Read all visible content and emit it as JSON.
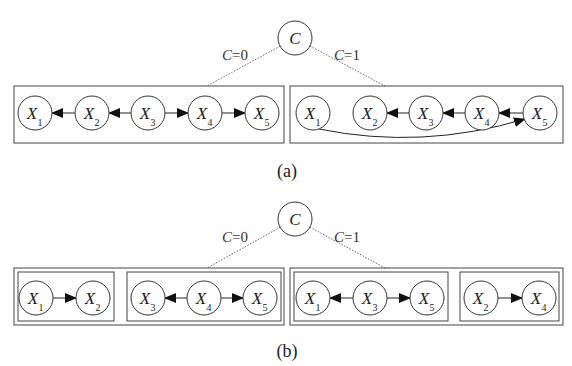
{
  "figure": {
    "panels": [
      {
        "id": "a",
        "caption": "(a)",
        "caption_pos": [
          287,
          177
        ],
        "root": {
          "label": "C",
          "x": 295,
          "y": 38,
          "r": 17
        },
        "branches": [
          {
            "label_var": "C",
            "label_val": "=0",
            "label_pos": [
              222,
              60
            ],
            "line_to": [
              207,
              86
            ]
          },
          {
            "label_var": "C",
            "label_val": "=1",
            "label_pos": [
              334,
              60
            ],
            "line_to": [
              385,
              86
            ]
          }
        ],
        "groups": [
          {
            "name": "c0-network",
            "outer": {
              "x": 14,
              "y": 86,
              "w": 270,
              "h": 57
            },
            "inner": [],
            "nodes": [
              {
                "id": "X1",
                "var": "X",
                "sub": "1",
                "x": 35,
                "y": 113
              },
              {
                "id": "X2",
                "var": "X",
                "sub": "2",
                "x": 92,
                "y": 113
              },
              {
                "id": "X3",
                "var": "X",
                "sub": "3",
                "x": 148,
                "y": 113
              },
              {
                "id": "X4",
                "var": "X",
                "sub": "4",
                "x": 205,
                "y": 113
              },
              {
                "id": "X5",
                "var": "X",
                "sub": "5",
                "x": 262,
                "y": 113
              }
            ],
            "edges": [
              {
                "from": "X2",
                "to": "X1"
              },
              {
                "from": "X3",
                "to": "X2"
              },
              {
                "from": "X3",
                "to": "X4"
              },
              {
                "from": "X4",
                "to": "X5"
              }
            ]
          },
          {
            "name": "c1-network",
            "outer": {
              "x": 290,
              "y": 86,
              "w": 273,
              "h": 57
            },
            "inner": [],
            "nodes": [
              {
                "id": "X1",
                "var": "X",
                "sub": "1",
                "x": 313,
                "y": 113
              },
              {
                "id": "X2",
                "var": "X",
                "sub": "2",
                "x": 370,
                "y": 113
              },
              {
                "id": "X3",
                "var": "X",
                "sub": "3",
                "x": 426,
                "y": 113
              },
              {
                "id": "X4",
                "var": "X",
                "sub": "4",
                "x": 482,
                "y": 113
              },
              {
                "id": "X5",
                "var": "X",
                "sub": "5",
                "x": 540,
                "y": 113
              }
            ],
            "edges": [
              {
                "from": "X3",
                "to": "X2"
              },
              {
                "from": "X4",
                "to": "X3"
              },
              {
                "from": "X5",
                "to": "X4"
              },
              {
                "from": "X1",
                "to": "X5",
                "curved": true
              }
            ]
          }
        ]
      },
      {
        "id": "b",
        "caption": "(b)",
        "caption_pos": [
          287,
          357
        ],
        "root": {
          "label": "C",
          "x": 295,
          "y": 219,
          "r": 17
        },
        "branches": [
          {
            "label_var": "C",
            "label_val": "=0",
            "label_pos": [
              222,
              242
            ],
            "line_to": [
              207,
              268
            ]
          },
          {
            "label_var": "C",
            "label_val": "=1",
            "label_pos": [
              334,
              242
            ],
            "line_to": [
              385,
              268
            ]
          }
        ],
        "groups": [
          {
            "name": "c0-network",
            "outer": {
              "x": 14,
              "y": 268,
              "w": 270,
              "h": 57
            },
            "inner": [
              {
                "x": 18,
                "y": 272,
                "w": 96,
                "h": 49
              },
              {
                "x": 127,
                "y": 272,
                "w": 154,
                "h": 49
              }
            ],
            "nodes": [
              {
                "id": "X1",
                "var": "X",
                "sub": "1",
                "x": 36,
                "y": 298
              },
              {
                "id": "X2",
                "var": "X",
                "sub": "2",
                "x": 93,
                "y": 298
              },
              {
                "id": "X3",
                "var": "X",
                "sub": "3",
                "x": 148,
                "y": 298
              },
              {
                "id": "X4",
                "var": "X",
                "sub": "4",
                "x": 204,
                "y": 298
              },
              {
                "id": "X5",
                "var": "X",
                "sub": "5",
                "x": 260,
                "y": 298
              }
            ],
            "edges": [
              {
                "from": "X1",
                "to": "X2"
              },
              {
                "from": "X4",
                "to": "X3"
              },
              {
                "from": "X4",
                "to": "X5"
              }
            ]
          },
          {
            "name": "c1-network",
            "outer": {
              "x": 290,
              "y": 268,
              "w": 273,
              "h": 57
            },
            "inner": [
              {
                "x": 294,
                "y": 272,
                "w": 154,
                "h": 49
              },
              {
                "x": 460,
                "y": 272,
                "w": 99,
                "h": 49
              }
            ],
            "nodes": [
              {
                "id": "X1",
                "var": "X",
                "sub": "1",
                "x": 313,
                "y": 298
              },
              {
                "id": "X3",
                "var": "X",
                "sub": "3",
                "x": 370,
                "y": 298
              },
              {
                "id": "X5",
                "var": "X",
                "sub": "5",
                "x": 427,
                "y": 298
              },
              {
                "id": "X2",
                "var": "X",
                "sub": "2",
                "x": 481,
                "y": 298
              },
              {
                "id": "X4",
                "var": "X",
                "sub": "4",
                "x": 539,
                "y": 298
              }
            ],
            "edges": [
              {
                "from": "X3",
                "to": "X1"
              },
              {
                "from": "X3",
                "to": "X5"
              },
              {
                "from": "X2",
                "to": "X4"
              }
            ]
          }
        ]
      }
    ],
    "node_radius": 17,
    "colors": {
      "stroke": "#333333",
      "box": "#444444",
      "dotted": "#666666",
      "text": "#222222",
      "background": "#ffffff"
    }
  }
}
